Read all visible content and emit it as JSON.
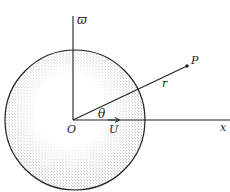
{
  "diagram": {
    "labels": {
      "vertical_axis": "ϖ",
      "horizontal_axis": "x",
      "origin": "O",
      "point": "P",
      "radius": "r",
      "angle": "θ",
      "velocity": "U"
    },
    "colors": {
      "line": "#222222",
      "stipple": "#555555",
      "background": "#ffffff"
    }
  }
}
